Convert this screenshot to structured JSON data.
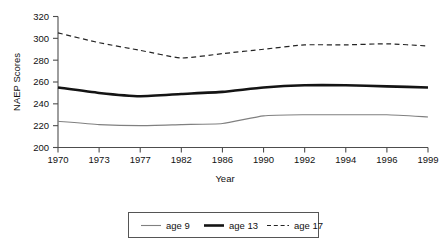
{
  "chart_data": {
    "type": "line",
    "title": "",
    "xlabel": "Year",
    "ylabel": "NAEP Scores",
    "categories": [
      "1970",
      "1973",
      "1977",
      "1982",
      "1986",
      "1990",
      "1992",
      "1994",
      "1996",
      "1999"
    ],
    "xtick_labels": [
      "1970",
      "1973",
      "1977",
      "1982",
      "1986",
      "1990",
      "1992",
      "1994",
      "1996",
      "1999"
    ],
    "ytick_labels": [
      "200",
      "220",
      "240",
      "260",
      "280",
      "300",
      "320"
    ],
    "ytick_values": [
      200,
      220,
      240,
      260,
      280,
      300,
      320
    ],
    "ylim": [
      200,
      320
    ],
    "grid": false,
    "legend_position": "bottom-outside",
    "series": [
      {
        "name": "age 9",
        "style": "thin-solid",
        "color": "#808080",
        "values": [
          224,
          221,
          220,
          221,
          222,
          229,
          230,
          230,
          230,
          228
        ]
      },
      {
        "name": "age 13",
        "style": "thick-solid",
        "color": "#141414",
        "values": [
          255,
          250,
          247,
          249,
          251,
          255,
          257,
          257,
          256,
          255
        ]
      },
      {
        "name": "age 17",
        "style": "dashed",
        "color": "#242424",
        "values": [
          305,
          296,
          289,
          282,
          286,
          290,
          294,
          294,
          295,
          293
        ]
      }
    ],
    "legend_entries": [
      {
        "label": "age 9",
        "style": "thin-solid",
        "color": "#808080"
      },
      {
        "label": "age 13",
        "style": "thick-solid",
        "color": "#141414"
      },
      {
        "label": "age 17",
        "style": "dashed",
        "color": "#242424"
      }
    ]
  }
}
